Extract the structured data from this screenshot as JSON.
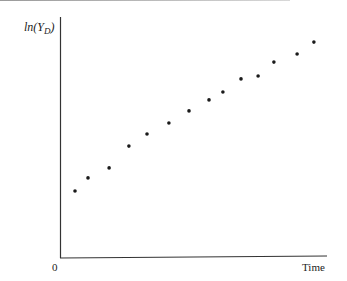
{
  "chart_data": {
    "type": "scatter",
    "title": "",
    "xlabel": "Time",
    "ylabel": "ln(Y_D)",
    "ylabel_display": {
      "prefix": "ln(",
      "var": "Y",
      "sub": "D",
      "suffix": ")"
    },
    "x_tick_labels": [
      "0"
    ],
    "grid": false,
    "legend": null,
    "xlim": [
      0,
      100
    ],
    "ylim": [
      0,
      100
    ],
    "points": [
      {
        "x": 5.6,
        "y": 32.2
      },
      {
        "x": 10.5,
        "y": 38.5
      },
      {
        "x": 18.4,
        "y": 43.3
      },
      {
        "x": 25.8,
        "y": 53.8
      },
      {
        "x": 32.6,
        "y": 59.6
      },
      {
        "x": 40.8,
        "y": 64.9
      },
      {
        "x": 48.3,
        "y": 70.7
      },
      {
        "x": 55.8,
        "y": 76.0
      },
      {
        "x": 61.0,
        "y": 79.8
      },
      {
        "x": 67.8,
        "y": 86.1
      },
      {
        "x": 74.2,
        "y": 87.5
      },
      {
        "x": 80.1,
        "y": 94.2
      },
      {
        "x": 88.8,
        "y": 98.1
      },
      {
        "x": 95.1,
        "y": 103.8
      }
    ],
    "point_color": "#1a1a1a",
    "axis_color": "#333333"
  }
}
